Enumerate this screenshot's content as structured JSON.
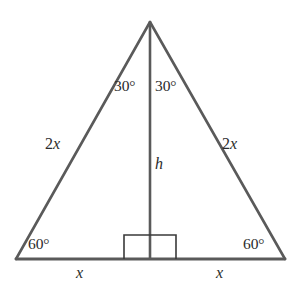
{
  "figure": {
    "name": "equilateral-triangle-with-altitude",
    "width": 301,
    "height": 294,
    "background_color": "#ffffff",
    "stroke_color": "#5a5a5a",
    "text_color": "#2b2b2b",
    "stroke_width": 2.6,
    "marker_stroke_width": 1.6
  },
  "geometry": {
    "apex": {
      "x": 150,
      "y": 22
    },
    "bottom_left": {
      "x": 16,
      "y": 259
    },
    "bottom_right": {
      "x": 285,
      "y": 259
    },
    "altitude_foot": {
      "x": 150,
      "y": 259
    },
    "right_angle_markers": [
      {
        "x1": 124,
        "y1": 235,
        "x2": 150,
        "y2": 259
      },
      {
        "x1": 150,
        "y1": 235,
        "x2": 176,
        "y2": 259
      }
    ]
  },
  "labels": {
    "angle_apex_left": "30°",
    "angle_apex_right": "30°",
    "side_left": "2x",
    "side_left_coefficient": "2",
    "side_left_variable": "x",
    "side_right": "2x",
    "side_right_coefficient": "2",
    "side_right_variable": "x",
    "height": "h",
    "angle_base_left": "60°",
    "angle_base_right": "60°",
    "base_left": "x",
    "base_right": "x"
  }
}
